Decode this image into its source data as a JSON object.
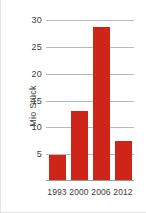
{
  "chart_data": {
    "type": "bar",
    "title": "",
    "xlabel": "",
    "ylabel": "Mio Stück",
    "categories": [
      "1993",
      "2000",
      "2006",
      "2012"
    ],
    "values": [
      4.7,
      12.9,
      28.5,
      7.3
    ],
    "series": [
      {
        "name": "Mio Stück",
        "values": [
          4.7,
          12.9,
          28.5,
          7.3
        ]
      }
    ],
    "ylim": [
      0,
      31.5
    ],
    "yticks": [
      5,
      10,
      15,
      20,
      25,
      30
    ],
    "ytick_labels": [
      "5",
      "10",
      "15",
      "20",
      "25",
      "30"
    ],
    "grid": true,
    "legend": false,
    "bar_color": "#cf2518",
    "grid_color": "#b9b9b9",
    "axis_color": "#9a9a9a",
    "text_color": "#3c3c3c"
  }
}
